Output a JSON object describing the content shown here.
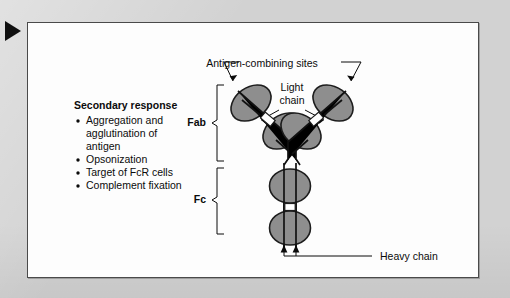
{
  "figure": {
    "title_block": {
      "heading": "Secondary response",
      "bullets": [
        "Aggregation and",
        "agglutination of",
        "antigen",
        "Opsonization",
        "Target of FcR cells",
        "Complement fixation"
      ],
      "bullet_items": [
        "Aggregation and agglutination of antigen",
        "Opsonization",
        "Target of FcR cells",
        "Complement fixation"
      ]
    },
    "labels": {
      "antigen_sites": "Antigen-combining sites",
      "light_chain_line1": "Light",
      "light_chain_line2": "chain",
      "fab": "Fab",
      "fc": "Fc",
      "heavy_chain": "Heavy chain"
    },
    "colors": {
      "page_background": "#d2d2d2",
      "panel_background": "#fdfdfd",
      "panel_border": "#4a4a4a",
      "domain_fill": "#8e8e8e",
      "domain_stroke": "#1d1d1d",
      "text": "#0b0b0b",
      "marker": "#101010"
    },
    "diagram": {
      "subject": "antibody-immunoglobulin-y-structure",
      "domain_count": 8,
      "fab_arms": 2,
      "fc_domains": 2
    }
  }
}
